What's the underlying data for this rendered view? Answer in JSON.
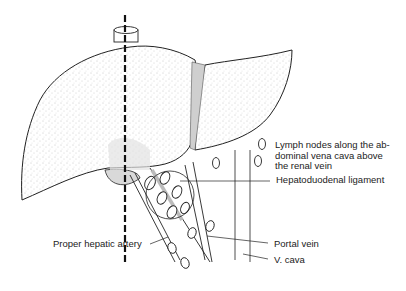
{
  "diagram": {
    "labels": {
      "lymph_nodes": "Lymph nodes along the ab-\ndominal vena cava above\nthe renal vein",
      "hepatoduodenal_ligament": "Hepatoduodenal ligament",
      "proper_hepatic_artery": "Proper hepatic artery",
      "portal_vein": "Portal vein",
      "v_cava": "V. cava"
    },
    "colors": {
      "outline": "#222222",
      "stipple": "#9a9a9a",
      "highlight": "#d6d6d6",
      "background": "#ffffff"
    }
  }
}
